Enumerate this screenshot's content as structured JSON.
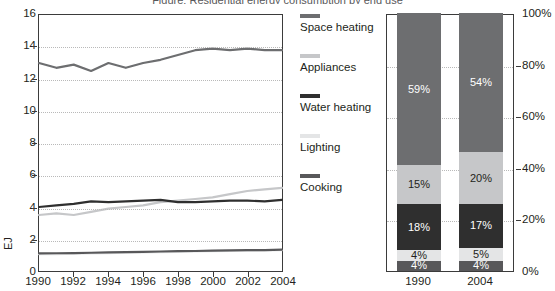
{
  "title_strip": "Figure: Residential energy consumption by end use",
  "colors": {
    "space_heating": "#6d6e70",
    "appliances": "#c6c7c9",
    "water_heating": "#2f2f2f",
    "lighting": "#e4e5e6",
    "cooking": "#58585a",
    "axis": "#3b3b3b",
    "grid": "#b9b9b9",
    "text": "#231f20"
  },
  "legend": {
    "items": [
      {
        "label": "Space heating",
        "color": "#6d6e70"
      },
      {
        "label": "Appliances",
        "color": "#c6c7c9"
      },
      {
        "label": "Water heating",
        "color": "#2f2f2f"
      },
      {
        "label": "Lighting",
        "color": "#e4e5e6"
      },
      {
        "label": "Cooking",
        "color": "#58585a"
      }
    ]
  },
  "chart_data": [
    {
      "type": "line",
      "title": "",
      "xlabel": "",
      "ylabel": "EJ",
      "xlim": [
        1990,
        2004
      ],
      "ylim": [
        0,
        16
      ],
      "yticks": [
        0,
        2,
        4,
        6,
        8,
        10,
        12,
        14,
        16
      ],
      "xticks": [
        1990,
        1992,
        1994,
        1996,
        1998,
        2000,
        2002,
        2004
      ],
      "ytick_labels": [
        "0",
        "2",
        "4",
        "6",
        "8",
        "10",
        "12",
        "14",
        "16"
      ],
      "xtick_labels": [
        "1990",
        "1992",
        "1994",
        "1996",
        "1998",
        "2000",
        "2002",
        "2004"
      ],
      "grid": true,
      "legend_position": "right",
      "x": [
        1990,
        1991,
        1992,
        1993,
        1994,
        1995,
        1996,
        1997,
        1998,
        1999,
        2000,
        2001,
        2002,
        2003,
        2004
      ],
      "series": [
        {
          "name": "Space heating",
          "color": "#6d6e70",
          "values": [
            13.0,
            12.7,
            12.9,
            12.5,
            13.0,
            12.7,
            13.0,
            13.2,
            13.5,
            13.8,
            13.9,
            13.8,
            13.9,
            13.8,
            13.8
          ]
        },
        {
          "name": "Appliances",
          "color": "#c6c7c9",
          "values": [
            3.5,
            3.6,
            3.5,
            3.7,
            3.9,
            4.0,
            4.1,
            4.3,
            4.4,
            4.5,
            4.6,
            4.8,
            5.0,
            5.1,
            5.2
          ]
        },
        {
          "name": "Water heating",
          "color": "#2f2f2f",
          "values": [
            4.0,
            4.1,
            4.2,
            4.35,
            4.3,
            4.35,
            4.4,
            4.45,
            4.3,
            4.3,
            4.35,
            4.4,
            4.4,
            4.35,
            4.45
          ]
        },
        {
          "name": "Lighting",
          "color": "#e4e5e6",
          "values": [
            1.05,
            1.06,
            1.08,
            1.1,
            1.12,
            1.14,
            1.16,
            1.18,
            1.2,
            1.22,
            1.24,
            1.26,
            1.27,
            1.28,
            1.3
          ]
        },
        {
          "name": "Cooking",
          "color": "#58585a",
          "values": [
            1.1,
            1.11,
            1.12,
            1.14,
            1.16,
            1.18,
            1.2,
            1.22,
            1.24,
            1.25,
            1.27,
            1.29,
            1.3,
            1.31,
            1.33
          ]
        }
      ]
    },
    {
      "type": "bar",
      "subtype": "stacked-percent",
      "title": "",
      "xlabel": "",
      "ylabel": "",
      "ylim": [
        0,
        100
      ],
      "yticks": [
        0,
        20,
        40,
        60,
        80,
        100
      ],
      "ytick_labels": [
        "0%",
        "20%",
        "40%",
        "60%",
        "80%",
        "100%"
      ],
      "grid": true,
      "legend_position": "shared-left",
      "categories": [
        "1990",
        "2004"
      ],
      "stack_order_bottom_to_top": [
        "Cooking",
        "Lighting",
        "Water heating",
        "Appliances",
        "Space heating"
      ],
      "series": [
        {
          "name": "Cooking",
          "color": "#58585a",
          "text_color": "#ffffff",
          "values": [
            4,
            4
          ],
          "labels": [
            "4%",
            "4%"
          ]
        },
        {
          "name": "Lighting",
          "color": "#e4e5e6",
          "text_color": "#231f20",
          "values": [
            4,
            5
          ],
          "labels": [
            "4%",
            "5%"
          ]
        },
        {
          "name": "Water heating",
          "color": "#2f2f2f",
          "text_color": "#ffffff",
          "values": [
            18,
            17
          ],
          "labels": [
            "18%",
            "17%"
          ]
        },
        {
          "name": "Appliances",
          "color": "#c6c7c9",
          "text_color": "#231f20",
          "values": [
            15,
            20
          ],
          "labels": [
            "15%",
            "20%"
          ]
        },
        {
          "name": "Space heating",
          "color": "#6d6e70",
          "text_color": "#ffffff",
          "values": [
            59,
            54
          ],
          "labels": [
            "59%",
            "54%"
          ]
        }
      ]
    }
  ]
}
